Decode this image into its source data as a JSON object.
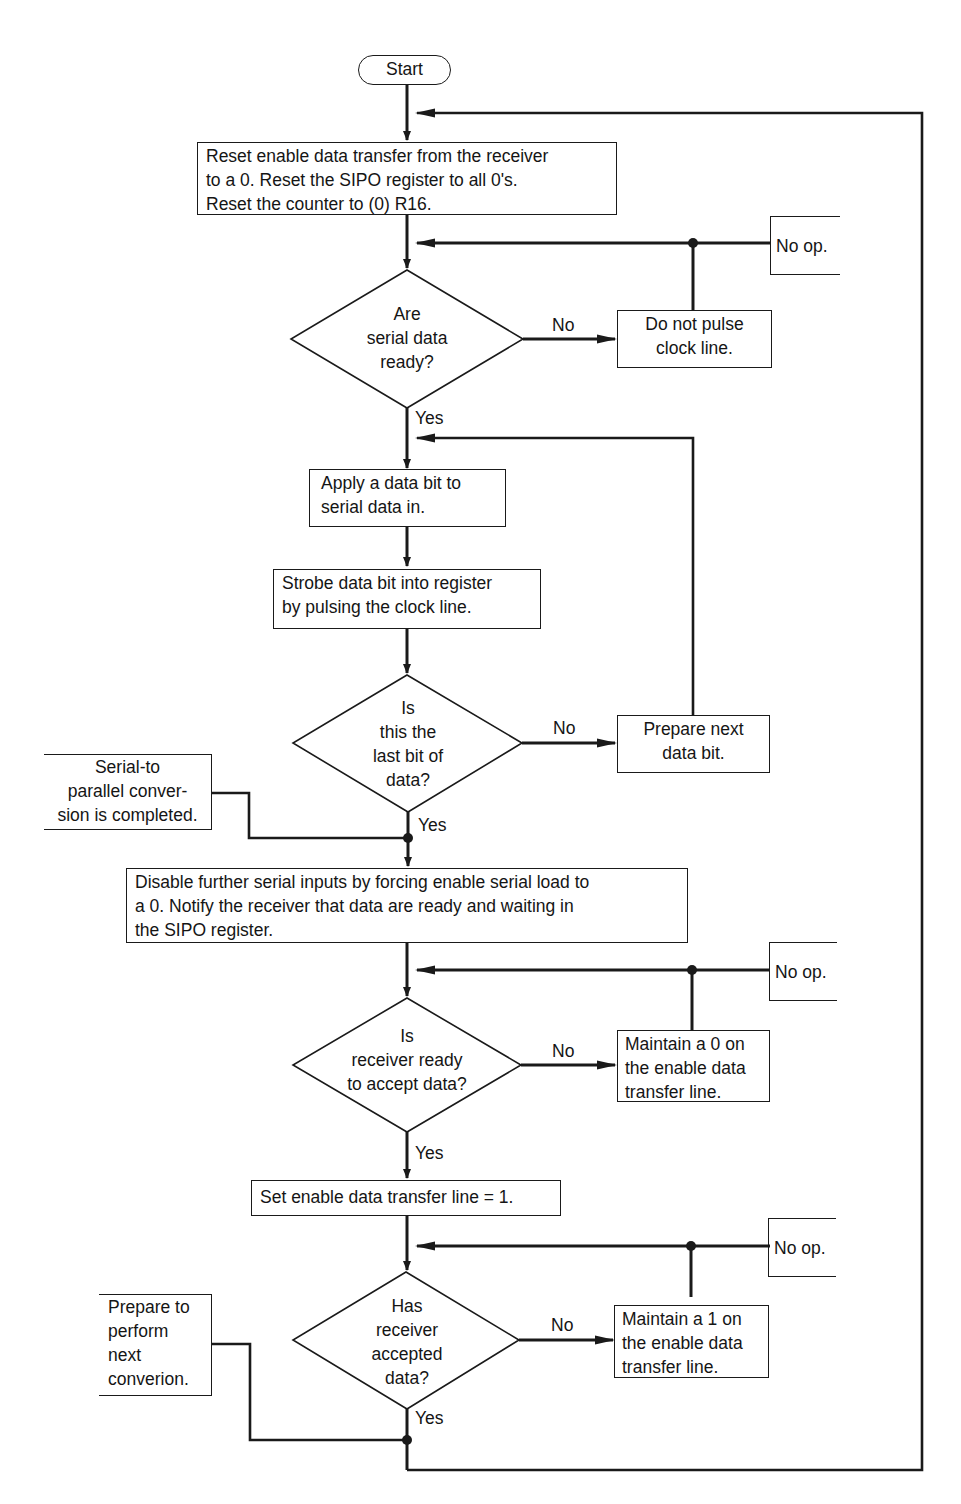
{
  "flowchart": {
    "start": {
      "label": "Start"
    },
    "reset_box": {
      "lines": [
        "Reset enable data transfer from the receiver",
        "to a 0.  Reset the SIPO register to all 0's.",
        "Reset the counter to (0) R16."
      ]
    },
    "decision_serial_ready": {
      "lines": [
        "Are",
        "serial data",
        "ready?"
      ],
      "no_label": "No",
      "yes_label": "Yes"
    },
    "do_not_pulse_box": {
      "lines": [
        "Do not pulse",
        "clock line."
      ]
    },
    "noop_1": {
      "label": "No op."
    },
    "apply_bit_box": {
      "lines": [
        "Apply a data bit to",
        "serial data in."
      ]
    },
    "strobe_box": {
      "lines": [
        "Strobe data bit into register",
        "by pulsing the clock line."
      ]
    },
    "decision_last_bit": {
      "lines": [
        "Is",
        "this the",
        "last bit of",
        "data?"
      ],
      "no_label": "No",
      "yes_label": "Yes"
    },
    "prepare_next_bit_box": {
      "lines": [
        "Prepare next",
        "data bit."
      ]
    },
    "annotation_conversion_complete": {
      "lines": [
        "Serial-to",
        "parallel conver-",
        "sion is completed."
      ]
    },
    "disable_box": {
      "lines": [
        "Disable further serial inputs by forcing enable serial load to",
        "a 0.  Notify the receiver that data are ready and waiting in",
        "the SIPO register."
      ]
    },
    "decision_receiver_ready": {
      "lines": [
        "Is",
        "receiver ready",
        "to accept data?"
      ],
      "no_label": "No",
      "yes_label": "Yes"
    },
    "maintain_0_box": {
      "lines": [
        "Maintain a 0 on",
        "the enable data",
        "transfer line."
      ]
    },
    "noop_2": {
      "label": "No op."
    },
    "set_enable_box": {
      "lines": [
        "Set enable data transfer line = 1."
      ]
    },
    "decision_receiver_accepted": {
      "lines": [
        "Has",
        "receiver",
        "accepted",
        "data?"
      ],
      "no_label": "No",
      "yes_label": "Yes"
    },
    "maintain_1_box": {
      "lines": [
        "Maintain a 1 on",
        "the enable data",
        "transfer line."
      ]
    },
    "noop_3": {
      "label": "No op."
    },
    "annotation_next_conversion": {
      "lines": [
        "Prepare to",
        "perform",
        "next",
        "converion."
      ]
    }
  },
  "colors": {
    "ink": "#1a1a1a",
    "paper": "#ffffff"
  }
}
